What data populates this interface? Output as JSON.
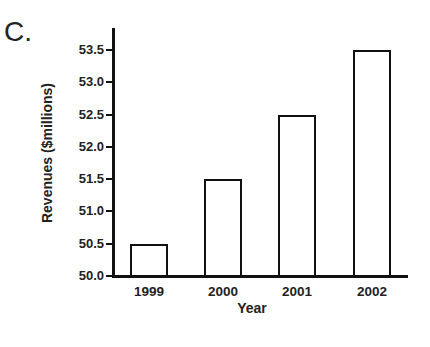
{
  "panel_label": "C.",
  "chart_data": {
    "type": "bar",
    "title": "",
    "xlabel": "Year",
    "ylabel": "Revenues ($millions)",
    "categories": [
      "1999",
      "2000",
      "2001",
      "2002"
    ],
    "values": [
      50.5,
      51.5,
      52.5,
      53.5
    ],
    "ylim": [
      50.0,
      53.7
    ],
    "yticks": [
      "50.0",
      "50.5",
      "51.0",
      "51.5",
      "52.0",
      "52.5",
      "53.0",
      "53.5"
    ],
    "grid": false,
    "legend": null,
    "bar_style": {
      "fill": "#ffffff",
      "stroke": "#111111"
    }
  }
}
